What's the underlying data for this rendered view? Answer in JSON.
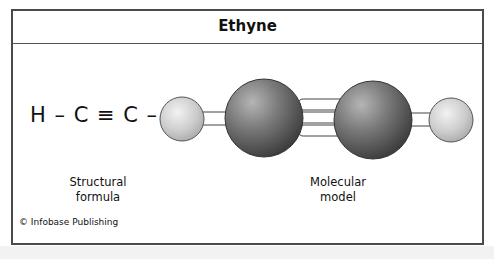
{
  "title": "Ethyne",
  "structural": {
    "formula": "H – C ≡ C – H",
    "label_line1": "Structural",
    "label_line2": "formula"
  },
  "model": {
    "label_line1": "Molecular",
    "label_line2": "model",
    "atoms": [
      "H",
      "C",
      "C",
      "H"
    ],
    "bonds": [
      "single",
      "triple",
      "single"
    ],
    "colors": {
      "hydrogen": "#cfcfcf",
      "carbon": "#6e6e6e",
      "bond": "#ffffff"
    }
  },
  "credit": "© Infobase Publishing"
}
